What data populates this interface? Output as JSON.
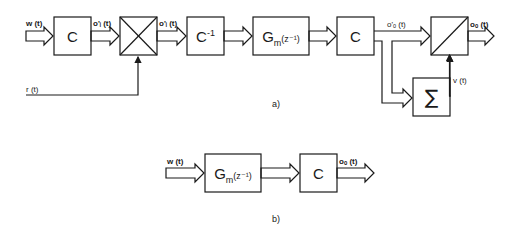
{
  "diagram_a": {
    "caption": "a)",
    "blocks": [
      {
        "id": "c1",
        "label": "C"
      },
      {
        "id": "mult",
        "label": "×",
        "kind": "multiplier"
      },
      {
        "id": "cinv",
        "label": "C",
        "sup": "-1"
      },
      {
        "id": "gm",
        "label": "G",
        "sub": "m",
        "arg": "(z⁻¹)"
      },
      {
        "id": "c2",
        "label": "C"
      },
      {
        "id": "div",
        "label": "/",
        "kind": "divider"
      },
      {
        "id": "sum",
        "label": "∑",
        "kind": "summation"
      }
    ],
    "signals": {
      "input": "w (t)",
      "after_c1": "o'ᵢ (t)",
      "after_mult": "o'ᵢ (t)",
      "reference": "r (t)",
      "after_c2": "o'ₒ (t)",
      "sum_out": "v (t)",
      "output": "oₒ (t)"
    }
  },
  "diagram_b": {
    "caption": "b)",
    "blocks": [
      {
        "id": "gm",
        "label": "G",
        "sub": "m",
        "arg": "(z⁻¹)"
      },
      {
        "id": "c",
        "label": "C"
      }
    ],
    "signals": {
      "input": "w (t)",
      "output": "oₒ (t)"
    }
  }
}
